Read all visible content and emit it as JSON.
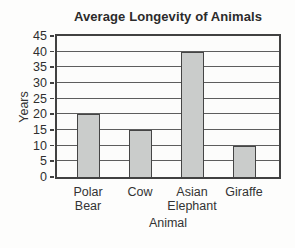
{
  "chart_data": {
    "type": "bar",
    "title": "Average Longevity of Animals",
    "xlabel": "Animal",
    "ylabel": "Years",
    "categories": [
      "Polar Bear",
      "Cow",
      "Asian Elephant",
      "Giraffe"
    ],
    "values": [
      20,
      15,
      40,
      10
    ],
    "ylim": [
      0,
      45
    ],
    "ytick_step": 5,
    "yticks": [
      0,
      5,
      10,
      15,
      20,
      25,
      30,
      35,
      40,
      45
    ],
    "grid": "horizontal",
    "legend": "none",
    "colors": {
      "bar_fill": "#cacccb",
      "bar_border": "#454545",
      "axis": "#414141",
      "gridline": "#5d5d5d",
      "text": "#2f2f2f",
      "background": "#fdfdfc"
    }
  }
}
